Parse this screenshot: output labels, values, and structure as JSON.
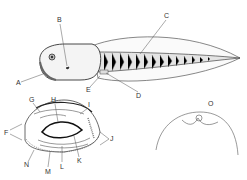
{
  "figure": {
    "panels": {
      "main": {
        "labels": [
          {
            "id": "A",
            "x": 16,
            "y": 83
          },
          {
            "id": "B",
            "x": 57,
            "y": 17
          },
          {
            "id": "C",
            "x": 164,
            "y": 13
          },
          {
            "id": "D",
            "x": 136,
            "y": 94
          },
          {
            "id": "E",
            "x": 87,
            "y": 88
          }
        ]
      },
      "mouth": {
        "labels": [
          {
            "id": "F",
            "x": 5,
            "y": 132
          },
          {
            "id": "G",
            "x": 30,
            "y": 98
          },
          {
            "id": "H",
            "x": 52,
            "y": 97
          },
          {
            "id": "I",
            "x": 87,
            "y": 102
          },
          {
            "id": "J",
            "x": 111,
            "y": 137
          },
          {
            "id": "K",
            "x": 77,
            "y": 159
          },
          {
            "id": "L",
            "x": 60,
            "y": 164
          },
          {
            "id": "M",
            "x": 46,
            "y": 169
          },
          {
            "id": "N",
            "x": 25,
            "y": 162
          }
        ]
      },
      "spiracle": {
        "labels": [
          {
            "id": "O",
            "x": 209,
            "y": 102
          }
        ]
      }
    },
    "colors": {
      "line": "#333333",
      "fill": "#f2f2f2",
      "shade": "#888888"
    }
  }
}
